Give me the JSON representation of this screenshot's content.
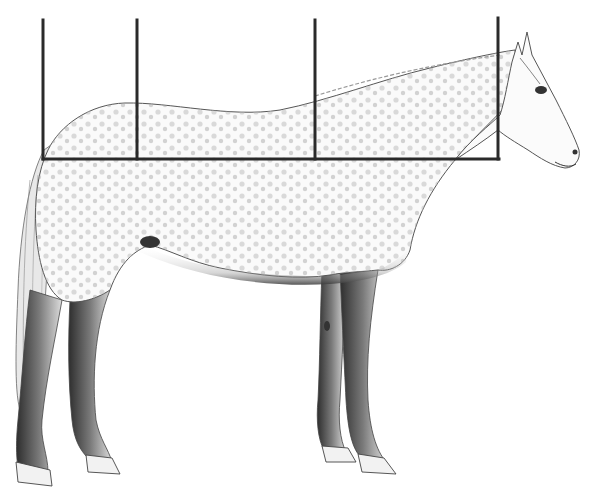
{
  "illustration": {
    "subject": "grey dappled horse standing in profile facing right (pencil drawing)",
    "colors": {
      "background": "#ffffff",
      "measure_lines": "#2a2a2a",
      "outline": "#555555",
      "shade_dark": "#3a3a3a",
      "shade_mid": "#8a8a8a",
      "shade_light": "#c8c8c8"
    },
    "measurement_grid": {
      "vertical_lines_x": [
        43,
        137,
        315,
        498
      ],
      "vertical_top_y": [
        20,
        20,
        20,
        18
      ],
      "horizontal_line_y": 159,
      "horizontal_from_x": 43,
      "horizontal_to_x": 499
    }
  }
}
